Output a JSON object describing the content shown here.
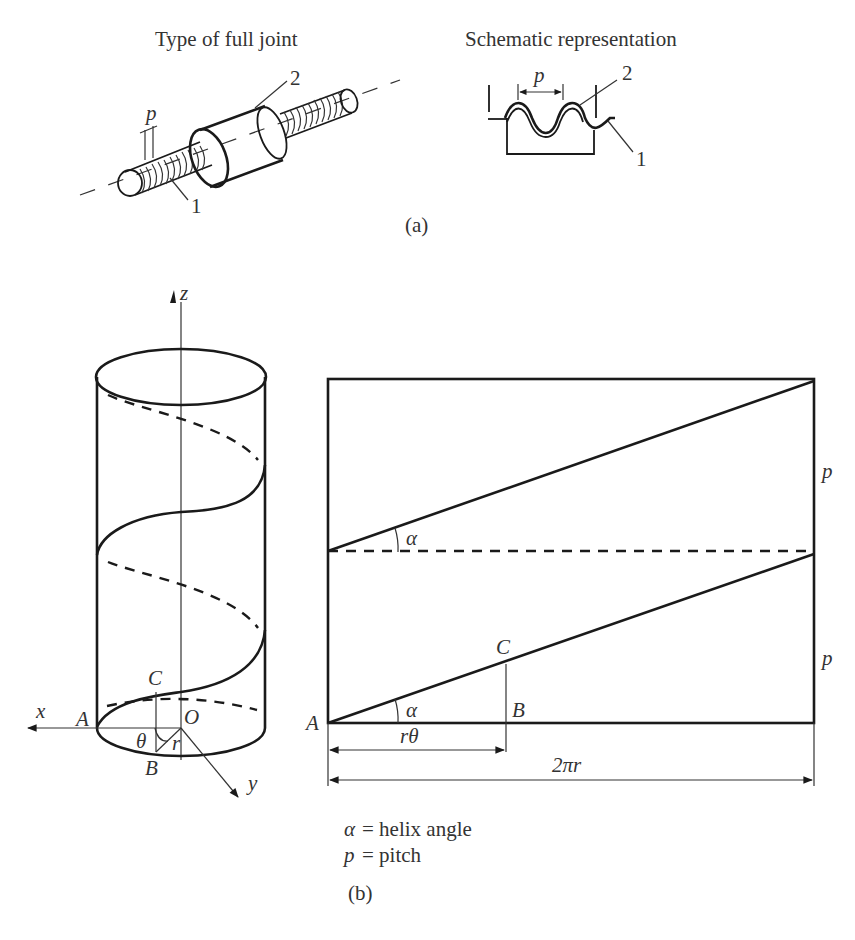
{
  "panel_a": {
    "left_title": "Type of full joint",
    "right_title": "Schematic representation",
    "label_pitch": "p",
    "label_part_1": "1",
    "label_part_2": "2",
    "schematic_pitch": "p",
    "schematic_part_1": "1",
    "schematic_part_2": "2",
    "caption": "(a)"
  },
  "panel_b": {
    "cylinder": {
      "axis_z": "z",
      "axis_x": "x",
      "axis_y": "y",
      "point_A": "A",
      "point_O": "O",
      "point_B": "B",
      "point_C": "C",
      "angle_theta": "θ",
      "radius_r": "r"
    },
    "development": {
      "point_A": "A",
      "point_B": "B",
      "point_C": "C",
      "angle_upper": "α",
      "angle_lower": "α",
      "pitch_upper": "p",
      "pitch_lower": "p",
      "dim_rtheta": "rθ",
      "dim_circumference": "2πr"
    },
    "legend": {
      "line1_sym": "α",
      "line1_text": "= helix angle",
      "line2_sym": "p",
      "line2_text": "= pitch"
    },
    "caption": "(b)"
  }
}
